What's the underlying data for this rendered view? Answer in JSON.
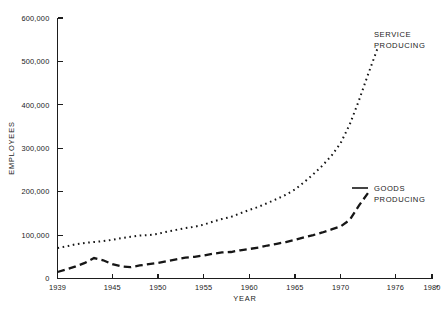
{
  "chart_data": {
    "type": "line",
    "title": "",
    "xlabel": "YEAR",
    "ylabel": "EMPLOYEES",
    "xlim": [
      1939,
      1980
    ],
    "ylim": [
      0,
      600000
    ],
    "grid": false,
    "legend_position": "inline-annotation",
    "x_ticks": [
      "1939",
      "1945",
      "1950",
      "1955",
      "1960",
      "1965",
      "1970",
      "1976",
      "1980"
    ],
    "x_tick_values": [
      1939,
      1945,
      1950,
      1955,
      1960,
      1965,
      1970,
      1976,
      1980
    ],
    "y_ticks": [
      "0",
      "100,000",
      "200,000",
      "300,000",
      "400,000",
      "500,000",
      "600,000"
    ],
    "y_tick_values": [
      0,
      100000,
      200000,
      300000,
      400000,
      500000,
      600000
    ],
    "footnote_marker": "*",
    "series": [
      {
        "name": "SERVICE PRODUCING",
        "style": "dotted",
        "label_line1": "SERVICE",
        "label_line2": "PRODUCING",
        "x": [
          1939,
          1940,
          1941,
          1942,
          1943,
          1944,
          1945,
          1946,
          1947,
          1948,
          1949,
          1950,
          1951,
          1952,
          1953,
          1954,
          1955,
          1956,
          1957,
          1958,
          1959,
          1960,
          1961,
          1962,
          1963,
          1964,
          1965,
          1966,
          1967,
          1968,
          1969,
          1970,
          1971,
          1972,
          1973,
          1974
        ],
        "values": [
          70000,
          74000,
          79000,
          82000,
          84000,
          86000,
          89000,
          93000,
          96000,
          99000,
          100000,
          103000,
          108000,
          112000,
          116000,
          119000,
          124000,
          131000,
          137000,
          142000,
          150000,
          158000,
          165000,
          174000,
          183000,
          193000,
          205000,
          222000,
          240000,
          260000,
          283000,
          312000,
          355000,
          410000,
          470000,
          528000
        ]
      },
      {
        "name": "GOODS PRODUCING",
        "style": "dashed",
        "label_line1": "GOODS",
        "label_line2": "PRODUCING",
        "x": [
          1939,
          1940,
          1941,
          1942,
          1943,
          1944,
          1945,
          1946,
          1947,
          1948,
          1949,
          1950,
          1951,
          1952,
          1953,
          1954,
          1955,
          1956,
          1957,
          1958,
          1959,
          1960,
          1961,
          1962,
          1963,
          1964,
          1965,
          1966,
          1967,
          1968,
          1969,
          1970,
          1971,
          1972,
          1973
        ],
        "values": [
          15000,
          21000,
          28000,
          36000,
          47000,
          42000,
          33000,
          28000,
          26000,
          30000,
          33000,
          36000,
          40000,
          44000,
          48000,
          50000,
          53000,
          57000,
          60000,
          61000,
          65000,
          68000,
          71000,
          76000,
          80000,
          84000,
          89000,
          95000,
          100000,
          106000,
          113000,
          120000,
          135000,
          168000,
          197000
        ]
      }
    ]
  }
}
